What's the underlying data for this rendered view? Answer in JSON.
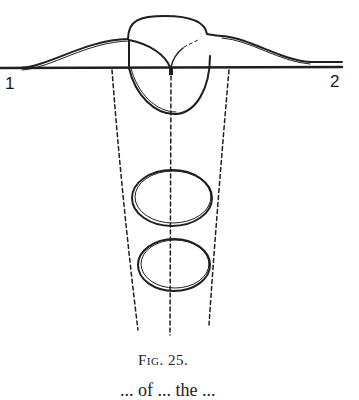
{
  "figure": {
    "caption": "Fig. 25.",
    "labels": {
      "left": "1",
      "right": "2"
    },
    "colors": {
      "ink": "#1f1f1f",
      "paper": "#ffffff"
    }
  },
  "body_text": {
    "clipped_line": "... of ... the ..."
  }
}
